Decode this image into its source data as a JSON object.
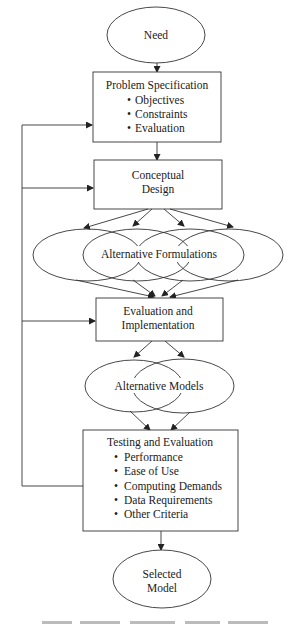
{
  "nodes": {
    "need": {
      "label": "Need"
    },
    "problem_spec": {
      "title": "Problem Specification",
      "bullets": [
        "Objectives",
        "Constraints",
        "Evaluation"
      ]
    },
    "conceptual_design": {
      "lines": [
        "Conceptual",
        "Design"
      ]
    },
    "alt_formulations": {
      "label": "Alternative Formulations"
    },
    "eval_impl": {
      "lines": [
        "Evaluation and",
        "Implementation"
      ]
    },
    "alt_models": {
      "label": "Alternative Models"
    },
    "testing_eval": {
      "title": "Testing and Evaluation",
      "bullets": [
        "Performance",
        "Ease of Use",
        "Computing Demands",
        "Data Requirements",
        "Other Criteria"
      ]
    },
    "selected_model": {
      "lines": [
        "Selected",
        "Model"
      ]
    }
  },
  "bullet_glyph": "•"
}
